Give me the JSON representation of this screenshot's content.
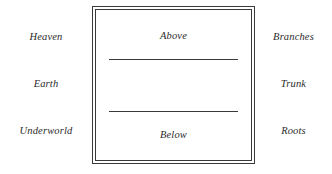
{
  "diagram": {
    "colors": {
      "background": "#ffffff",
      "rule": "#3a3a3a",
      "text": "#2b2b2b"
    },
    "left_column": {
      "name": "cosmological-realms",
      "labels": [
        "Heaven",
        "Earth",
        "Underworld"
      ]
    },
    "center_box": {
      "name": "world-axis-box",
      "border_style": "double-ruled rectangle",
      "zones": [
        {
          "key": "above",
          "label": "Above"
        },
        {
          "key": "middle",
          "label": ""
        },
        {
          "key": "below",
          "label": "Below"
        }
      ],
      "dividers": [
        "divider-upper",
        "divider-lower"
      ]
    },
    "right_column": {
      "name": "tree-parts",
      "labels": [
        "Branches",
        "Trunk",
        "Roots"
      ]
    }
  }
}
